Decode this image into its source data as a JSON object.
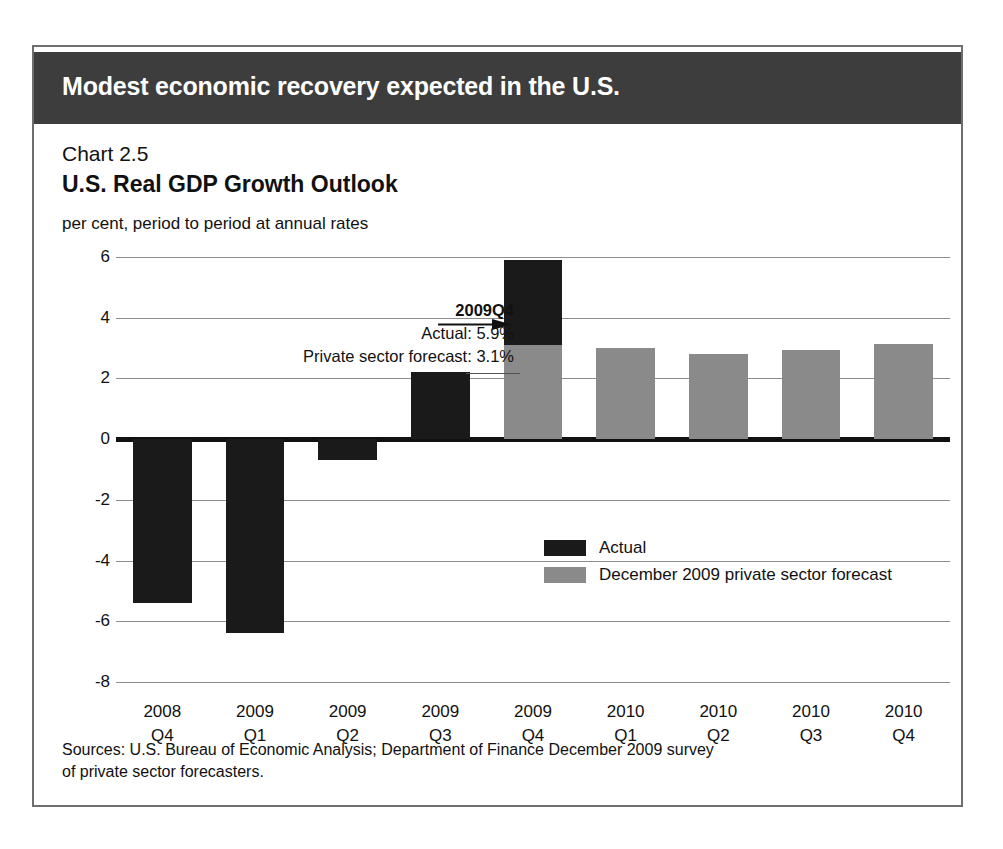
{
  "banner": {
    "title": "Modest economic recovery expected in the U.S."
  },
  "chart_label": "Chart 2.5",
  "source_note_line1": "Sources: U.S. Bureau of Economic Analysis; Department of Finance December 2009 survey",
  "source_note_line2": "of private sector forecasters.",
  "annotation": {
    "lead": "2009Q4",
    "line2": "Actual: 5.9%",
    "line3": "Private sector forecast: 3.1%"
  },
  "chart_data": {
    "type": "bar",
    "title": "U.S. Real GDP Growth Outlook",
    "subtitle": "Chart 2.5",
    "ylabel": "per cent, period to period at annual rates",
    "xlabel": "",
    "ylim": [
      -8,
      6
    ],
    "yticks": [
      6,
      4,
      2,
      0,
      -2,
      -4,
      -6,
      -8
    ],
    "ytick_labels": [
      "6",
      "4",
      "2",
      "0",
      "-2",
      "-4",
      "-6",
      "-8"
    ],
    "grid": true,
    "legend_position": "inside-right",
    "categories": [
      "2008 Q4",
      "2009 Q1",
      "2009 Q2",
      "2009 Q3",
      "2009 Q4",
      "2010 Q1",
      "2010 Q2",
      "2010 Q3",
      "2010 Q4"
    ],
    "category_lines": [
      [
        "2008",
        "Q4"
      ],
      [
        "2009",
        "Q1"
      ],
      [
        "2009",
        "Q2"
      ],
      [
        "2009",
        "Q3"
      ],
      [
        "2009",
        "Q4"
      ],
      [
        "2010",
        "Q1"
      ],
      [
        "2010",
        "Q2"
      ],
      [
        "2010",
        "Q3"
      ],
      [
        "2010",
        "Q4"
      ]
    ],
    "series": [
      {
        "name": "Actual",
        "color": "#1a1a1a",
        "values": [
          -5.4,
          -6.4,
          -0.7,
          2.2,
          5.9,
          null,
          null,
          null,
          null
        ]
      },
      {
        "name": "December 2009 private sector forecast",
        "color": "#8a8a8a",
        "values": [
          null,
          null,
          null,
          null,
          3.1,
          3.0,
          2.8,
          2.95,
          3.15
        ]
      }
    ],
    "annotations": [
      {
        "text": "2009Q4",
        "target_category": "2009 Q4"
      },
      {
        "text": "Actual: 5.9%",
        "target_category": "2009 Q4"
      },
      {
        "text": "Private sector forecast: 3.1%",
        "target_category": "2009 Q4"
      }
    ]
  },
  "colors": {
    "banner": "#3d3d3d",
    "actual": "#1a1a1a",
    "forecast": "#8a8a8a",
    "grid": "#8d8d8d",
    "border": "#6e6e6e"
  }
}
